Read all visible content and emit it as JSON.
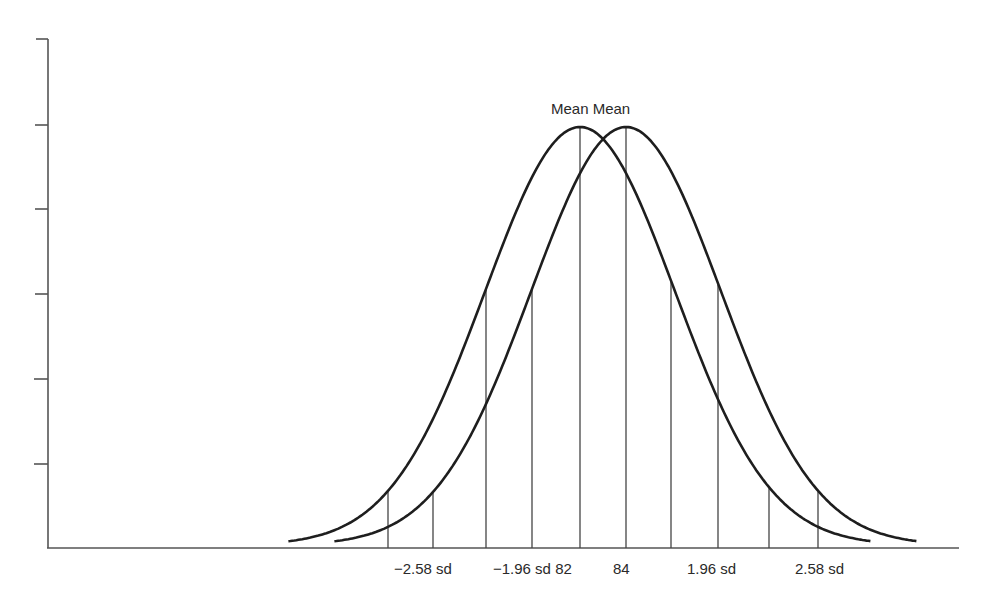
{
  "chart_data": {
    "type": "line",
    "title": "",
    "xlabel": "",
    "ylabel": "",
    "top_labels": [
      "Mean",
      "Mean"
    ],
    "top_label_text": "Mean Mean",
    "x_tick_labels": [
      "−2.58 sd",
      "−1.96 sd",
      "82",
      "84",
      "1.96 sd",
      "2.58 sd"
    ],
    "series": [
      {
        "name": "Distribution 1",
        "mean": 82,
        "sd_px": 95,
        "center_px": 580
      },
      {
        "name": "Distribution 2",
        "mean": 84,
        "sd_px": 95,
        "center_px": 626
      }
    ],
    "reference_lines_x_px": [
      388,
      433,
      486,
      532,
      580,
      626,
      671,
      718,
      769,
      818
    ],
    "y_ticks_count": 6,
    "grid": false,
    "colors": {
      "curve": "#1e1e1e",
      "axis": "#555555",
      "lines": "#444444",
      "text": "#2a2a2a"
    }
  },
  "labels": {
    "mean_text": "Mean Mean",
    "neg_258": "−2.58 sd",
    "neg_196_82": "−1.96 sd 82",
    "m84": "84",
    "pos_196": "1.96 sd",
    "pos_258": "2.58 sd"
  }
}
